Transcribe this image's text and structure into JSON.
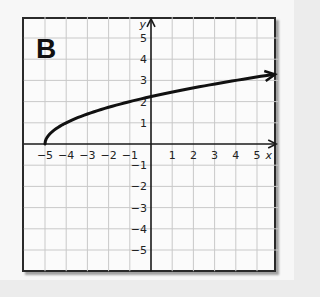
{
  "panel_label": "B",
  "chart_data": {
    "type": "line",
    "title": "",
    "xlabel": "x",
    "ylabel": "y",
    "xlim": [
      -6,
      6
    ],
    "ylim": [
      -6,
      6
    ],
    "grid": true,
    "x_ticks": [
      -5,
      -4,
      -3,
      -2,
      -1,
      1,
      2,
      3,
      4,
      5
    ],
    "y_ticks": [
      5,
      4,
      3,
      2,
      1,
      -1,
      -2,
      -3,
      -4,
      -5
    ],
    "x_tick_labels": [
      "−5",
      "−4",
      "−3",
      "−2",
      "−1",
      "1",
      "2",
      "3",
      "4",
      "5"
    ],
    "y_tick_labels": [
      "5",
      "4",
      "3",
      "2",
      "1",
      "−1",
      "−2",
      "−3",
      "−4",
      "−5"
    ],
    "series": [
      {
        "name": "y = √(x + 5)",
        "start_point": [
          -5,
          0
        ],
        "end_arrow": true,
        "x": [
          -5,
          -4.75,
          -4,
          -3,
          -2,
          -1,
          0,
          1,
          2,
          3,
          4,
          5,
          5.8
        ],
        "values": [
          0,
          0.5,
          1,
          1.41,
          1.73,
          2,
          2.24,
          2.45,
          2.65,
          2.83,
          3,
          3.16,
          3.29
        ]
      }
    ]
  }
}
